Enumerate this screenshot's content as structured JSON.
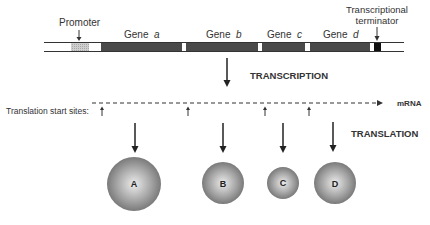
{
  "diagram": {
    "labels": {
      "promoter": "Promoter",
      "gene_prefix": "Gene",
      "terminator_line1": "Transcriptional",
      "terminator_line2": "terminator",
      "transcription": "TRANSCRIPTION",
      "mrna": "mRNA",
      "translation_start_sites": "Translation start  sites:",
      "translation": "TRANSLATION"
    },
    "genes": [
      {
        "letter": "a"
      },
      {
        "letter": "b"
      },
      {
        "letter": "c"
      },
      {
        "letter": "d"
      }
    ],
    "proteins": [
      {
        "label": "A"
      },
      {
        "label": "B"
      },
      {
        "label": "C"
      },
      {
        "label": "D"
      }
    ],
    "colors": {
      "gene_fill": "#4a4a4a",
      "promoter_fill": "#c4c4c4",
      "terminator_fill": "#111111",
      "protein_light": "#e6e6e6",
      "protein_dark": "#7a7a7a"
    }
  }
}
